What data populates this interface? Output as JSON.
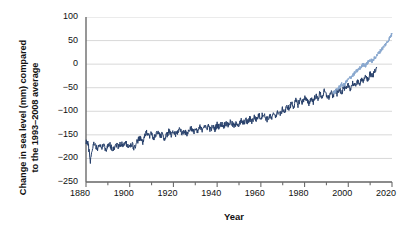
{
  "chart_data": {
    "type": "line",
    "title": "",
    "xlabel": "Year",
    "ylabel": "Change in sea level (mm) compared\nto the 1993–2008 average",
    "xlim": [
      1880,
      2020
    ],
    "ylim": [
      -250,
      100
    ],
    "xticks": [
      1880,
      1900,
      1920,
      1940,
      1960,
      1980,
      2000,
      2020
    ],
    "xtick_labels": [
      "1880",
      "1900",
      "1920",
      "1940",
      "1960",
      "1980",
      "2000",
      "2020"
    ],
    "xminor_ticks": [
      1890,
      1910,
      1930,
      1950,
      1970,
      1990,
      2010
    ],
    "yticks": [
      100,
      50,
      0,
      -50,
      -100,
      -150,
      -200,
      -250
    ],
    "ytick_labels": [
      "100",
      "50",
      "0",
      "−50",
      "−100",
      "−150",
      "−200",
      "−250"
    ],
    "grid": "horizontal",
    "legend": "none",
    "colors": {
      "tide_gauge": "#27406b",
      "satellite": "#89a8cf",
      "grid": "#d4d4d4",
      "axis": "#6b6b6b",
      "text": "#111111",
      "background": "#ffffff"
    },
    "series": [
      {
        "name": "tide_gauge",
        "label": "Tide gauge reconstruction",
        "color": "#27406b",
        "x_start": 1880,
        "x_end": 2013,
        "values": [
          -163,
          -170,
          -205,
          -176,
          -166,
          -180,
          -172,
          -178,
          -170,
          -181,
          -175,
          -171,
          -180,
          -176,
          -170,
          -175,
          -168,
          -174,
          -166,
          -172,
          -176,
          -170,
          -178,
          -168,
          -160,
          -158,
          -166,
          -152,
          -143,
          -152,
          -147,
          -158,
          -150,
          -144,
          -155,
          -148,
          -159,
          -150,
          -142,
          -152,
          -144,
          -150,
          -143,
          -136,
          -148,
          -140,
          -150,
          -142,
          -134,
          -145,
          -138,
          -146,
          -133,
          -140,
          -128,
          -138,
          -130,
          -140,
          -132,
          -138,
          -128,
          -134,
          -126,
          -132,
          -124,
          -130,
          -122,
          -128,
          -132,
          -124,
          -130,
          -120,
          -126,
          -118,
          -124,
          -115,
          -122,
          -112,
          -118,
          -108,
          -114,
          -105,
          -112,
          -118,
          -110,
          -116,
          -104,
          -110,
          -100,
          -106,
          -95,
          -102,
          -88,
          -96,
          -82,
          -90,
          -78,
          -86,
          -74,
          -82,
          -70,
          -78,
          -84,
          -72,
          -80,
          -66,
          -74,
          -62,
          -70,
          -58,
          -66,
          -72,
          -60,
          -68,
          -56,
          -64,
          -52,
          -60,
          -48,
          -56,
          -44,
          -52,
          -40,
          -48,
          -36,
          -44,
          -30,
          -38,
          -26,
          -34,
          -20,
          -28,
          -14,
          -6
        ]
      },
      {
        "name": "satellite",
        "label": "Satellite altimetry",
        "color": "#89a8cf",
        "x_start": 1993,
        "x_end": 2020,
        "values": [
          -62,
          -58,
          -53,
          -48,
          -43,
          -45,
          -38,
          -33,
          -28,
          -24,
          -19,
          -14,
          -10,
          -5,
          0,
          -3,
          4,
          9,
          6,
          13,
          18,
          24,
          30,
          36,
          42,
          48,
          56,
          64
        ]
      }
    ]
  }
}
